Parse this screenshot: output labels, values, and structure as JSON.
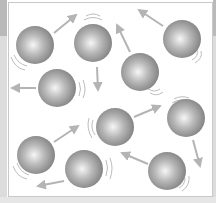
{
  "diagram": {
    "colors": {
      "sphere_highlight": "#f4f4f4",
      "sphere_mid": "#a9a9a9",
      "sphere_edge": "#7d7d7d",
      "arrow": "#b4b4b4",
      "motion_lines": "#bdbdbd",
      "frame_border": "#c9c9c9",
      "side_strip_dark": "#b9b9b9",
      "side_strip_light": "#dcdcdc"
    },
    "sphere_radius": 19,
    "molecules": [
      {
        "id": 1,
        "cx": 35,
        "cy": 45
      },
      {
        "id": 2,
        "cx": 93,
        "cy": 43
      },
      {
        "id": 3,
        "cx": 140,
        "cy": 72
      },
      {
        "id": 4,
        "cx": 182,
        "cy": 39
      },
      {
        "id": 5,
        "cx": 57,
        "cy": 88
      },
      {
        "id": 6,
        "cx": 36,
        "cy": 155
      },
      {
        "id": 7,
        "cx": 115,
        "cy": 127
      },
      {
        "id": 8,
        "cx": 186,
        "cy": 118
      },
      {
        "id": 9,
        "cx": 84,
        "cy": 169
      },
      {
        "id": 10,
        "cx": 167,
        "cy": 171
      }
    ],
    "arrows": [
      {
        "from": [
          54,
          33
        ],
        "to": [
          76,
          15
        ]
      },
      {
        "from": [
          97,
          67
        ],
        "to": [
          98,
          90
        ]
      },
      {
        "from": [
          130,
          52
        ],
        "to": [
          117,
          25
        ]
      },
      {
        "from": [
          163,
          26
        ],
        "to": [
          139,
          10
        ]
      },
      {
        "from": [
          36,
          88
        ],
        "to": [
          12,
          88
        ]
      },
      {
        "from": [
          54,
          142
        ],
        "to": [
          78,
          126
        ]
      },
      {
        "from": [
          134,
          117
        ],
        "to": [
          160,
          106
        ]
      },
      {
        "from": [
          193,
          140
        ],
        "to": [
          200,
          166
        ]
      },
      {
        "from": [
          148,
          164
        ],
        "to": [
          122,
          153
        ]
      },
      {
        "from": [
          64,
          181
        ],
        "to": [
          38,
          186
        ]
      }
    ]
  }
}
